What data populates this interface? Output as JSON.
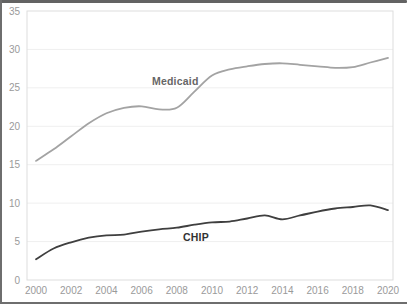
{
  "chart_data": {
    "type": "line",
    "title": "",
    "xlabel": "",
    "ylabel": "",
    "x": [
      2000,
      2001,
      2002,
      2003,
      2004,
      2005,
      2006,
      2007,
      2008,
      2009,
      2010,
      2011,
      2012,
      2013,
      2014,
      2015,
      2016,
      2017,
      2018,
      2019,
      2020
    ],
    "series": [
      {
        "name": "Medicaid",
        "color": "#a3a3a3",
        "label_color": "#666666",
        "values": [
          15.5,
          17.0,
          18.7,
          20.4,
          21.7,
          22.4,
          22.6,
          22.2,
          22.4,
          24.5,
          26.6,
          27.4,
          27.8,
          28.1,
          28.2,
          28.0,
          27.8,
          27.6,
          27.7,
          28.3,
          28.9
        ]
      },
      {
        "name": "CHIP",
        "color": "#3f3f3f",
        "label_color": "#333333",
        "values": [
          2.7,
          4.1,
          4.9,
          5.5,
          5.8,
          5.9,
          6.3,
          6.6,
          6.8,
          7.2,
          7.5,
          7.6,
          8.0,
          8.4,
          7.9,
          8.4,
          8.9,
          9.3,
          9.5,
          9.7,
          9.1
        ]
      }
    ],
    "xticks": [
      2000,
      2002,
      2004,
      2006,
      2008,
      2010,
      2012,
      2014,
      2016,
      2018,
      2020
    ],
    "yticks": [
      0,
      5,
      10,
      15,
      20,
      25,
      30,
      35
    ],
    "ylim": [
      0,
      35
    ],
    "xlim": [
      2000,
      2020
    ],
    "grid": "horizontal",
    "legend_position": "inline-labels"
  },
  "colors": {
    "background": "#ffffff",
    "plot_border": "#dddddd",
    "gridline": "#efefef",
    "tick_label": "#9a9a9a",
    "frame": "#6e6e6e"
  }
}
